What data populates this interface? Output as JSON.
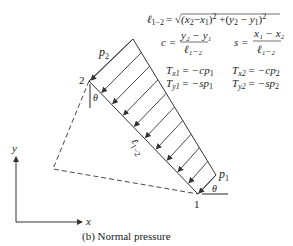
{
  "figure": {
    "caption": "(b) Normal pressure",
    "nodes": {
      "node1": {
        "label": "1",
        "x": 198,
        "y": 194
      },
      "node2": {
        "label": "2",
        "x": 89,
        "y": 81
      }
    },
    "pressure_labels": {
      "p1": "p",
      "p1_sub": "1",
      "p2": "p",
      "p2_sub": "2"
    },
    "element_length_label": {
      "main": "ℓ",
      "sub": "1−2"
    },
    "angle_label": "θ",
    "axes": {
      "x_label": "x",
      "y_label": "y"
    },
    "colors": {
      "line": "#333333",
      "gray_marker": "#777777",
      "background": "#ffffff"
    }
  },
  "formulas": {
    "length": {
      "lhs": "ℓ",
      "lhs_sub": "1−2",
      "rhs": "= √(x₂ − x₁)² + (y₂ − y₁)²"
    },
    "c": {
      "lhs": "c =",
      "num": "y₂ − y₁",
      "den": "ℓ₁₋₂"
    },
    "s": {
      "lhs": "s =",
      "num": "x₁ − x₂",
      "den": "ℓ₁₋₂"
    },
    "tx1": {
      "lhs": "T",
      "lhs_sub": "x1",
      "rhs": "= −cp",
      "rhs_sub": "1"
    },
    "tx2": {
      "lhs": "T",
      "lhs_sub": "x2",
      "rhs": "= −cp",
      "rhs_sub": "2"
    },
    "ty1": {
      "lhs": "T",
      "lhs_sub": "y1",
      "rhs": "= −sp",
      "rhs_sub": "1"
    },
    "ty2": {
      "lhs": "T",
      "lhs_sub": "y2",
      "rhs": "= −sp",
      "rhs_sub": "2"
    }
  }
}
